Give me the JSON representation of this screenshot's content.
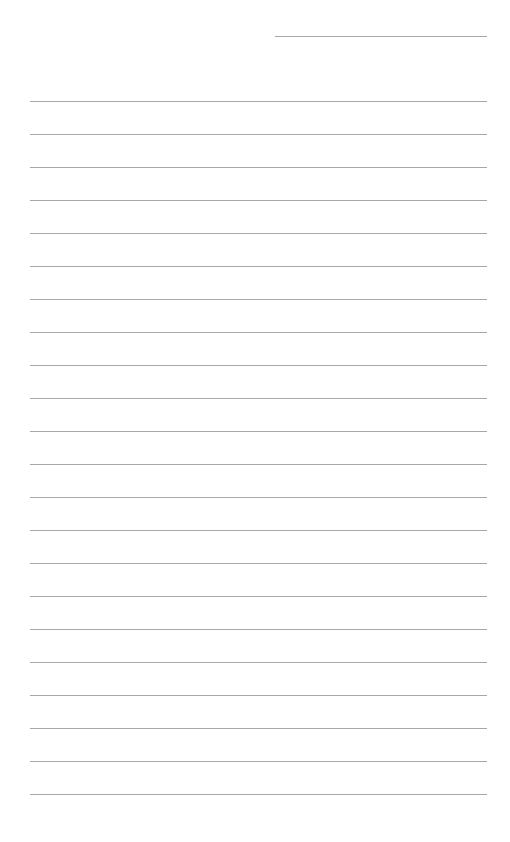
{
  "page": {
    "type": "lined-paper",
    "background_color": "#ffffff",
    "line_color": "#a8a8a8",
    "header": {
      "date_line": {
        "label": "",
        "value": ""
      }
    },
    "ruled_lines": {
      "count": 22,
      "first_top": 101,
      "spacing": 33,
      "left": 30,
      "width": 457
    },
    "lines": [
      "",
      "",
      "",
      "",
      "",
      "",
      "",
      "",
      "",
      "",
      "",
      "",
      "",
      "",
      "",
      "",
      "",
      "",
      "",
      "",
      "",
      ""
    ]
  }
}
